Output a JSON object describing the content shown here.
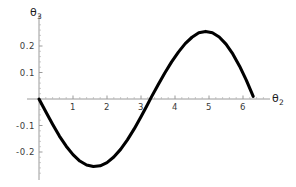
{
  "chart_data": {
    "type": "line",
    "title": "",
    "subtitle": "",
    "xlabel": "θ₂",
    "ylabel": "θ₃",
    "xlim": [
      -0.35,
      7.0
    ],
    "ylim": [
      -0.3,
      0.3
    ],
    "xticks": [
      1,
      2,
      3,
      4,
      5,
      6
    ],
    "xtick_labels": [
      "1",
      "2",
      "3",
      "4",
      "5",
      "6"
    ],
    "yticks": [
      -0.2,
      -0.1,
      0.1,
      0.2
    ],
    "ytick_labels": [
      "-0.2",
      "-0.1",
      "0.1",
      "0.2"
    ],
    "grid": false,
    "legend": null,
    "line_color": "#000000",
    "axis_color": "#9a9a9a",
    "background_color": "#ffffff",
    "series": [
      {
        "name": "θ₃(θ₂)",
        "amplitude": 0.255,
        "x": [
          0.0,
          0.2,
          0.4,
          0.6,
          0.8,
          1.0,
          1.2,
          1.4,
          1.6,
          1.8,
          2.0,
          2.2,
          2.4,
          2.6,
          2.8,
          3.0,
          3.15,
          3.3,
          3.5,
          3.7,
          3.9,
          4.1,
          4.3,
          4.5,
          4.7,
          4.9,
          5.1,
          5.3,
          5.5,
          5.7,
          5.9,
          6.1,
          6.3
        ],
        "y": [
          0.0,
          -0.048,
          -0.095,
          -0.14,
          -0.178,
          -0.21,
          -0.234,
          -0.249,
          -0.255,
          -0.252,
          -0.24,
          -0.219,
          -0.19,
          -0.154,
          -0.113,
          -0.067,
          -0.031,
          0.006,
          0.053,
          0.098,
          0.14,
          0.177,
          0.209,
          0.233,
          0.25,
          0.255,
          0.25,
          0.234,
          0.207,
          0.17,
          0.124,
          0.07,
          0.01
        ]
      }
    ],
    "annotations": {
      "zero_crossings": [
        0.0,
        3.15,
        6.3
      ],
      "maximum": {
        "x": 4.7,
        "y": 0.255
      },
      "minimum": {
        "x": 1.6,
        "y": -0.255
      }
    }
  }
}
